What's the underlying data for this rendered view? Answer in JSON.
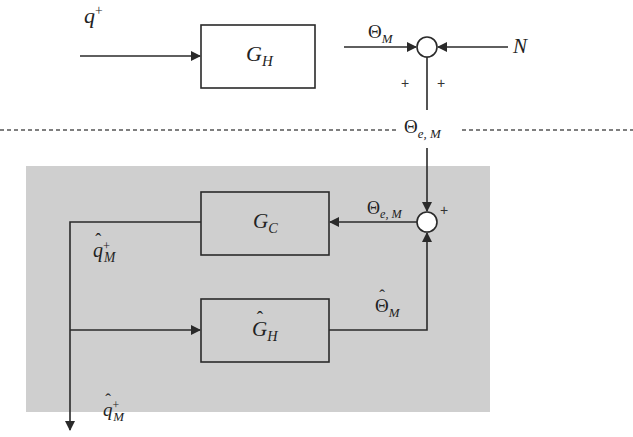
{
  "diagram": {
    "type": "block-diagram",
    "colors": {
      "line": "#2a2a2a",
      "shaded_region": "#cfcfcf",
      "background": "#ffffff",
      "dashed_divider": "#555555"
    },
    "blocks": {
      "plant": {
        "symbol": "G",
        "sub": "H",
        "hat": false
      },
      "controller": {
        "symbol": "G",
        "sub": "C",
        "hat": false
      },
      "model": {
        "symbol": "G",
        "sub": "H",
        "hat": true
      }
    },
    "signals": {
      "input": {
        "symbol": "q",
        "sup": "+"
      },
      "plant_output": {
        "symbol": "Θ",
        "sub": "M"
      },
      "noise": {
        "symbol": "N"
      },
      "error_top": {
        "symbol": "Θ",
        "sub": "e, M"
      },
      "error_inner": {
        "symbol": "Θ",
        "sub": "e, M"
      },
      "estimate_feedback": {
        "symbol": "q",
        "sup": "+",
        "sub": "M",
        "hat": true
      },
      "model_output": {
        "symbol": "Θ",
        "sub": "M",
        "hat": true
      },
      "estimate_output": {
        "symbol": "q",
        "sup": "+",
        "sub": "M",
        "hat": true
      }
    },
    "summing_junctions": {
      "top": {
        "signs": [
          "+",
          "+"
        ]
      },
      "inner": {
        "signs": [
          "+"
        ]
      }
    }
  }
}
